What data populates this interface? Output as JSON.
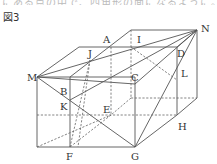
{
  "header": {
    "cutoff_text": "にある点の中で、四角形の面になるように。",
    "figure_title": "図3"
  },
  "labels": {
    "A": "A",
    "B": "B",
    "C": "C",
    "D": "D",
    "E": "E",
    "F": "F",
    "G": "G",
    "H": "H",
    "I": "I",
    "J": "J",
    "K": "K",
    "L": "L",
    "M": "M",
    "N": "N"
  },
  "colors": {
    "line": "#555555",
    "text": "#333333",
    "background": "#ffffff"
  }
}
